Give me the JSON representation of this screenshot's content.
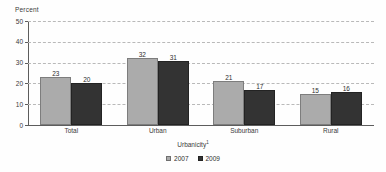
{
  "chart_data": {
    "type": "bar",
    "title": "",
    "xlabel": "Urbanicity",
    "xlabel_footnote": "1",
    "ylabel": "Percent",
    "categories": [
      "Total",
      "Urban",
      "Suburban",
      "Rural"
    ],
    "series": [
      {
        "name": "2007",
        "values": [
          23,
          32,
          21,
          15
        ],
        "color": "#ababab"
      },
      {
        "name": "2009",
        "values": [
          20,
          31,
          17,
          16
        ],
        "color": "#333333"
      }
    ],
    "ylim": [
      0,
      50
    ],
    "yticks": [
      0,
      10,
      20,
      30,
      40,
      50
    ],
    "ytick_labels": [
      "0",
      "10",
      "20",
      "30",
      "40",
      "50"
    ],
    "grid": true,
    "grid_style": "dashed-horizontal",
    "legend_position": "bottom-center",
    "data_labels": true
  },
  "legend": {
    "items": [
      {
        "label": "2007"
      },
      {
        "label": "2009"
      }
    ]
  }
}
